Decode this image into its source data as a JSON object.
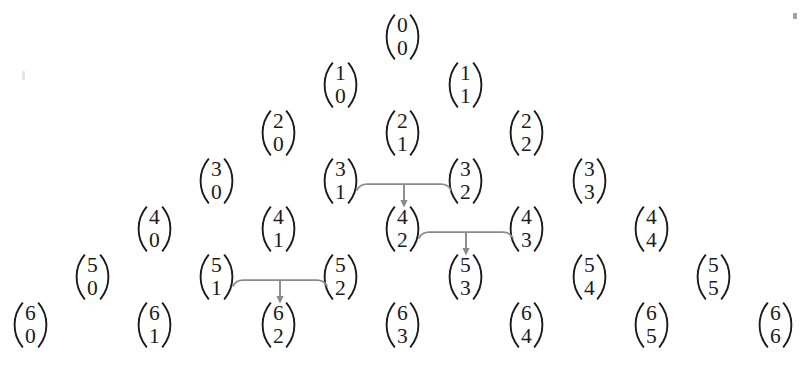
{
  "figure": {
    "type": "pascal-triangle",
    "text_color": "#1b1b1b",
    "background_color": "#ffffff",
    "arrow_color": "#8a8a8a",
    "rows": [
      {
        "n": 0,
        "cells": [
          {
            "label": "C(0,0)",
            "top": "0",
            "bottom": "0",
            "x": 385,
            "y": 14
          }
        ]
      },
      {
        "n": 1,
        "cells": [
          {
            "label": "C(1,0)",
            "top": "1",
            "bottom": "0",
            "x": 323,
            "y": 62
          },
          {
            "label": "C(1,1)",
            "top": "1",
            "bottom": "1",
            "x": 448,
            "y": 62
          }
        ]
      },
      {
        "n": 2,
        "cells": [
          {
            "label": "C(2,0)",
            "top": "2",
            "bottom": "0",
            "x": 261,
            "y": 110
          },
          {
            "label": "C(2,1)",
            "top": "2",
            "bottom": "1",
            "x": 385,
            "y": 110
          },
          {
            "label": "C(2,2)",
            "top": "2",
            "bottom": "2",
            "x": 509,
            "y": 110
          }
        ]
      },
      {
        "n": 3,
        "cells": [
          {
            "label": "C(3,0)",
            "top": "3",
            "bottom": "0",
            "x": 199,
            "y": 158
          },
          {
            "label": "C(3,1)",
            "top": "3",
            "bottom": "1",
            "x": 323,
            "y": 158
          },
          {
            "label": "C(3,2)",
            "top": "3",
            "bottom": "2",
            "x": 448,
            "y": 158
          },
          {
            "label": "C(3,3)",
            "top": "3",
            "bottom": "3",
            "x": 572,
            "y": 158
          }
        ]
      },
      {
        "n": 4,
        "cells": [
          {
            "label": "C(4,0)",
            "top": "4",
            "bottom": "0",
            "x": 137,
            "y": 206
          },
          {
            "label": "C(4,1)",
            "top": "4",
            "bottom": "1",
            "x": 261,
            "y": 206
          },
          {
            "label": "C(4,2)",
            "top": "4",
            "bottom": "2",
            "x": 385,
            "y": 206
          },
          {
            "label": "C(4,3)",
            "top": "4",
            "bottom": "3",
            "x": 509,
            "y": 206
          },
          {
            "label": "C(4,4)",
            "top": "4",
            "bottom": "4",
            "x": 634,
            "y": 206
          }
        ]
      },
      {
        "n": 5,
        "cells": [
          {
            "label": "C(5,0)",
            "top": "5",
            "bottom": "0",
            "x": 75,
            "y": 254
          },
          {
            "label": "C(5,1)",
            "top": "5",
            "bottom": "1",
            "x": 199,
            "y": 254
          },
          {
            "label": "C(5,2)",
            "top": "5",
            "bottom": "2",
            "x": 323,
            "y": 254
          },
          {
            "label": "C(5,3)",
            "top": "5",
            "bottom": "3",
            "x": 448,
            "y": 254
          },
          {
            "label": "C(5,4)",
            "top": "5",
            "bottom": "4",
            "x": 572,
            "y": 254
          },
          {
            "label": "C(5,5)",
            "top": "5",
            "bottom": "5",
            "x": 696,
            "y": 254
          }
        ]
      },
      {
        "n": 6,
        "cells": [
          {
            "label": "C(6,0)",
            "top": "6",
            "bottom": "0",
            "x": 13,
            "y": 302
          },
          {
            "label": "C(6,1)",
            "top": "6",
            "bottom": "1",
            "x": 137,
            "y": 302
          },
          {
            "label": "C(6,2)",
            "top": "6",
            "bottom": "2",
            "x": 261,
            "y": 302
          },
          {
            "label": "C(6,3)",
            "top": "6",
            "bottom": "3",
            "x": 385,
            "y": 302
          },
          {
            "label": "C(6,4)",
            "top": "6",
            "bottom": "4",
            "x": 509,
            "y": 302
          },
          {
            "label": "C(6,5)",
            "top": "6",
            "bottom": "5",
            "x": 634,
            "y": 302
          },
          {
            "label": "C(6,6)",
            "top": "6",
            "bottom": "6",
            "x": 758,
            "y": 302
          }
        ]
      }
    ],
    "connectors": [
      {
        "label": "C(3,1) + C(3,2) -> C(4,2)",
        "from_left": "C(3,1)",
        "from_right": "C(3,2)",
        "to": "C(4,2)",
        "x": 356,
        "y": 182,
        "width": 96,
        "height": 26
      },
      {
        "label": "C(4,2) + C(4,3) -> C(5,3)",
        "from_left": "C(4,2)",
        "from_right": "C(4,3)",
        "to": "C(5,3)",
        "x": 418,
        "y": 230,
        "width": 96,
        "height": 26
      },
      {
        "label": "C(5,1) + C(5,2) -> C(6,2)",
        "from_left": "C(5,1)",
        "from_right": "C(5,2)",
        "to": "C(6,2)",
        "x": 232,
        "y": 278,
        "width": 96,
        "height": 26
      }
    ],
    "artifacts": [
      {
        "label": "scan-speck-top-right",
        "x": 793,
        "y": 13,
        "variant": "speck"
      },
      {
        "label": "scan-speck-left",
        "x": 22,
        "y": 71,
        "variant": "faint"
      }
    ]
  }
}
